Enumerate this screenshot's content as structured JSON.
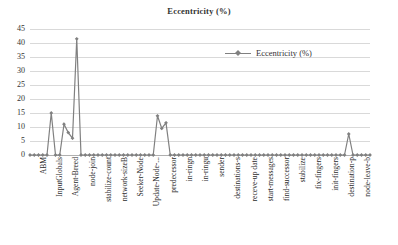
{
  "chart_data": {
    "type": "line",
    "title": "Eccentricity (%)",
    "xlabel": "",
    "ylabel": "",
    "ylim": [
      0,
      45
    ],
    "yticks": [
      0,
      5,
      10,
      15,
      20,
      25,
      30,
      35,
      40,
      45
    ],
    "grid": true,
    "legend": {
      "position": "top-right",
      "entries": [
        "Eccentricity (%)"
      ]
    },
    "marker": "diamond",
    "line_color": "#808080",
    "tick_labels": [
      "ABM",
      "InputGlobals",
      "Agent-Breed",
      "node-join",
      "stabilize-count",
      "network-sizeB",
      "Seeker-Node",
      "Update-Node-...",
      "predecessor",
      "in-ringn",
      "in-ringu",
      "sender",
      "destinations-s",
      "receve-up date",
      "start-messages",
      "find-successor",
      "stabilize",
      "fix-fingers",
      "init-fingers",
      "destination-p",
      "node-leave-b"
    ],
    "series": [
      {
        "name": "Eccentricity (%)",
        "values": [
          0,
          0,
          0,
          0,
          0,
          15,
          0,
          0,
          11,
          8,
          6,
          41.5,
          0,
          0,
          0,
          0,
          0,
          0,
          0,
          0,
          0,
          0,
          0,
          0,
          0,
          0,
          0,
          0,
          0,
          0,
          14,
          9.5,
          11.5,
          0,
          0,
          0,
          0,
          0,
          0,
          0,
          0,
          0,
          0,
          0,
          0,
          0,
          0,
          0,
          0,
          0,
          0,
          0,
          0,
          0,
          0,
          0,
          0,
          0,
          0,
          0,
          0,
          0,
          0,
          0,
          0,
          0,
          0,
          0,
          0,
          0,
          0,
          0,
          0,
          0,
          0,
          7.5,
          0,
          0,
          0,
          0,
          0
        ]
      }
    ]
  },
  "legend_label": "Eccentricity (%)"
}
